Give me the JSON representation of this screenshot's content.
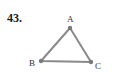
{
  "problem": {
    "number": "43."
  },
  "figure": {
    "type": "triangle",
    "line_color": "#8a8a8a",
    "point_color": "#7a7a7a",
    "vertices": [
      {
        "label": "A",
        "x": 70,
        "y": 28,
        "label_x": 67,
        "label_y": 22
      },
      {
        "label": "B",
        "x": 41,
        "y": 61,
        "label_x": 29,
        "label_y": 66
      },
      {
        "label": "C",
        "x": 91,
        "y": 62,
        "label_x": 95,
        "label_y": 69
      }
    ]
  }
}
